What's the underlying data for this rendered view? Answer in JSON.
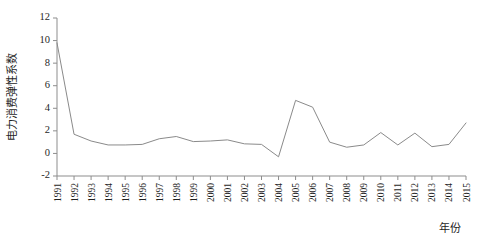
{
  "chart_data": {
    "type": "line",
    "title": "",
    "xlabel": "年份",
    "ylabel": "电力消费弹性系数",
    "xlim": [
      1991,
      2015
    ],
    "ylim": [
      -2,
      12
    ],
    "ytick_labels": [
      "12",
      "10",
      "8",
      "6",
      "4",
      "2",
      "0",
      "-2"
    ],
    "yticks": [
      12,
      10,
      8,
      6,
      4,
      2,
      0,
      -2
    ],
    "grid": false,
    "legend": null,
    "categories": [
      "1991",
      "1992",
      "1993",
      "1994",
      "1995",
      "1996",
      "1997",
      "1998",
      "1999",
      "2000",
      "2001",
      "2002",
      "2003",
      "2004",
      "2005",
      "2006",
      "2007",
      "2008",
      "2009",
      "2010",
      "2011",
      "2012",
      "2013",
      "2014",
      "2015"
    ],
    "values": [
      9.8,
      1.7,
      1.1,
      0.75,
      0.75,
      0.8,
      1.3,
      1.5,
      1.05,
      1.1,
      1.2,
      0.85,
      0.8,
      -0.3,
      4.7,
      4.1,
      1.0,
      0.55,
      0.75,
      1.85,
      0.75,
      1.8,
      0.6,
      0.8,
      2.7
    ],
    "series_name": "电力消费弹性系数",
    "line_color": "#8a8a8a",
    "axis_color": "#8d8d8d"
  },
  "figure": {
    "caption_fragment": "",
    "y_axis_title": "电力消费弹性系数",
    "x_axis_title": "年份"
  }
}
